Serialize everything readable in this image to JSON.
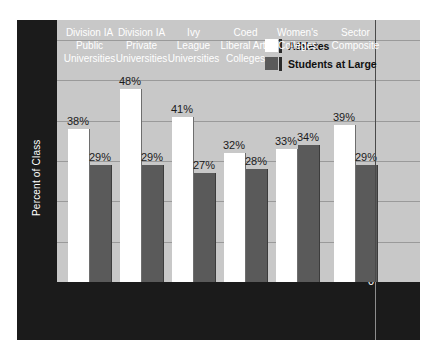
{
  "chart_data": {
    "type": "bar",
    "title": "",
    "xlabel": "",
    "ylabel": "Percent of Class",
    "ylim": [
      0,
      65
    ],
    "yticks": [
      0,
      10,
      20,
      30,
      40,
      50,
      60
    ],
    "grid": true,
    "legend_position": "top-center",
    "categories": [
      "Division IA Public Universities",
      "Division IA Private Universities",
      "Ivy League Universities",
      "Coed Liberal Arts Colleges",
      "Women's Colleges",
      "Sector Composite"
    ],
    "category_lines": [
      [
        "Division IA",
        "Public",
        "Universities"
      ],
      [
        "Division IA",
        "Private",
        "Universities"
      ],
      [
        "Ivy",
        "League",
        "Universities"
      ],
      [
        "Coed",
        "Liberal Arts",
        "Colleges"
      ],
      [
        "Women's",
        "Colleges"
      ],
      [
        "Sector",
        "Composite"
      ]
    ],
    "series": [
      {
        "name": "Athletes",
        "color": "#ffffff",
        "values": [
          38,
          48,
          41,
          32,
          33,
          39
        ],
        "labels": [
          "38%",
          "48%",
          "41%",
          "32%",
          "33%",
          "39%"
        ]
      },
      {
        "name": "Students at Large",
        "color": "#5a5a5a",
        "values": [
          29,
          29,
          27,
          28,
          34,
          29
        ],
        "labels": [
          "29%",
          "29%",
          "27%",
          "28%",
          "34%",
          "29%"
        ]
      }
    ],
    "separator_after_category_index": 4
  },
  "legend": {
    "items": [
      {
        "label": "Athletes"
      },
      {
        "label": "Students at Large"
      }
    ]
  },
  "axis": {
    "y_label": "Percent of Class",
    "tick_labels": [
      "60",
      "50",
      "40",
      "30",
      "20",
      "10",
      "0"
    ]
  },
  "colors": {
    "plot_background": "#c8c8c8",
    "frame": "#1b1b1b",
    "gridline": "#9a9a9a",
    "athletes": "#ffffff",
    "students": "#5a5a5a",
    "text_light": "#ffffff",
    "text_dark": "#1b1b1b"
  }
}
